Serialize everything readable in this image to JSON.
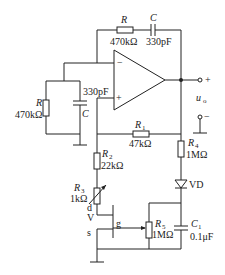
{
  "circuit": {
    "feedback_R": {
      "name": "R",
      "value": "470kΩ"
    },
    "feedback_C": {
      "name": "C",
      "value": "330pF"
    },
    "ground_R": {
      "name": "R",
      "value": "470kΩ"
    },
    "ground_C": {
      "name": "C",
      "value": "330pF"
    },
    "R1": {
      "name": "R",
      "sub": "1",
      "value": "47kΩ"
    },
    "R2": {
      "name": "R",
      "sub": "2",
      "value": "22kΩ"
    },
    "R3": {
      "name": "R",
      "sub": "3",
      "value": "1kΩ"
    },
    "R4": {
      "name": "R",
      "sub": "4",
      "value": "1MΩ"
    },
    "R5": {
      "name": "R",
      "sub": "5",
      "value": "1MΩ"
    },
    "C1": {
      "name": "C",
      "sub": "1",
      "value": "0.1μF"
    },
    "diode": {
      "name": "VD"
    },
    "fet": {
      "name": "V",
      "drain": "d",
      "gate": "g",
      "source": "s"
    },
    "opamp": {
      "minus": "−",
      "plus": "+"
    },
    "output": {
      "name": "u",
      "sub": "o",
      "plus": "+",
      "minus": "−"
    }
  }
}
